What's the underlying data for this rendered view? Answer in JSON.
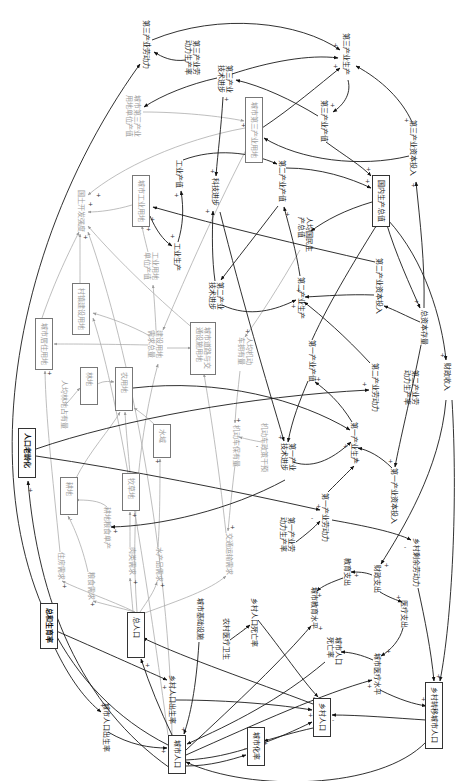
{
  "diagram": {
    "nodes": [
      {
        "label": "第三产业劳动力",
        "boxed": false,
        "tone": "black"
      },
      {
        "label": "第三产业劳动力生产率",
        "boxed": false,
        "tone": "black"
      },
      {
        "label": "城市第三产业用地单位产值",
        "boxed": false,
        "tone": "gray"
      },
      {
        "label": "第三产业技术进步",
        "boxed": false,
        "tone": "black"
      },
      {
        "label": "第三产业生产",
        "boxed": false,
        "tone": "black"
      },
      {
        "label": "第三产业产值",
        "boxed": false,
        "tone": "black"
      },
      {
        "label": "城市第三产业用地",
        "boxed": true,
        "tone": "gray"
      },
      {
        "label": "第三产业资本投入",
        "boxed": false,
        "tone": "black"
      },
      {
        "label": "工业产值",
        "boxed": false,
        "tone": "black"
      },
      {
        "label": "科技进步",
        "boxed": false,
        "tone": "black"
      },
      {
        "label": "第二产业产值",
        "boxed": false,
        "tone": "black"
      },
      {
        "label": "国内生产总值",
        "boxed": true,
        "tone": "black"
      },
      {
        "label": "城市工业用地",
        "boxed": true,
        "tone": "gray"
      },
      {
        "label": "国土开发强度",
        "boxed": false,
        "tone": "gray"
      },
      {
        "label": "工业生产",
        "boxed": false,
        "tone": "black"
      },
      {
        "label": "工业用地单位产值",
        "boxed": false,
        "tone": "gray"
      },
      {
        "label": "人均国民生产总值",
        "boxed": false,
        "tone": "black"
      },
      {
        "label": "第二产业技术进步",
        "boxed": false,
        "tone": "black"
      },
      {
        "label": "第二产业生产",
        "boxed": false,
        "tone": "black"
      },
      {
        "label": "第二产业资本投入",
        "boxed": false,
        "tone": "black"
      },
      {
        "label": "总资本存量",
        "boxed": false,
        "tone": "black"
      },
      {
        "label": "村镇建设用地",
        "boxed": true,
        "tone": "gray"
      },
      {
        "label": "城市居住用地",
        "boxed": true,
        "tone": "gray"
      },
      {
        "label": "建设用地需求总量",
        "boxed": false,
        "tone": "gray"
      },
      {
        "label": "城市道路与交通设施用地",
        "boxed": true,
        "tone": "gray"
      },
      {
        "label": "人均机动车拥有量",
        "boxed": false,
        "tone": "gray"
      },
      {
        "label": "第一产业产值",
        "boxed": false,
        "tone": "black"
      },
      {
        "label": "第二产业劳动力",
        "boxed": false,
        "tone": "black"
      },
      {
        "label": "第二产业劳动力生产率",
        "boxed": false,
        "tone": "black"
      },
      {
        "label": "财政收入",
        "boxed": false,
        "tone": "black"
      },
      {
        "label": "林地",
        "boxed": true,
        "tone": "gray"
      },
      {
        "label": "农用地",
        "boxed": true,
        "tone": "gray"
      },
      {
        "label": "人均林地占有量",
        "boxed": false,
        "tone": "gray"
      },
      {
        "label": "水域",
        "boxed": true,
        "tone": "gray"
      },
      {
        "label": "人口老龄化",
        "boxed": true,
        "tone": "black"
      },
      {
        "label": "第一产业生产",
        "boxed": false,
        "tone": "black"
      },
      {
        "label": "机动车保有量",
        "boxed": false,
        "tone": "gray"
      },
      {
        "label": "机动车政策干预",
        "boxed": false,
        "tone": "gray"
      },
      {
        "label": "第一产业技术进步",
        "boxed": false,
        "tone": "black"
      },
      {
        "label": "第一产业资本投入",
        "boxed": false,
        "tone": "black"
      },
      {
        "label": "耕地",
        "boxed": true,
        "tone": "gray"
      },
      {
        "label": "牧草地",
        "boxed": true,
        "tone": "gray"
      },
      {
        "label": "第一产业劳动力",
        "boxed": false,
        "tone": "black"
      },
      {
        "label": "耕地粮食单产",
        "boxed": false,
        "tone": "gray"
      },
      {
        "label": "第一产业劳动力生产率",
        "boxed": false,
        "tone": "black"
      },
      {
        "label": "交通运输需求",
        "boxed": false,
        "tone": "gray"
      },
      {
        "label": "乡村剩余劳动力",
        "boxed": false,
        "tone": "black"
      },
      {
        "label": "住房需求",
        "boxed": false,
        "tone": "gray"
      },
      {
        "label": "肉类需求",
        "boxed": false,
        "tone": "gray"
      },
      {
        "label": "水产品需求",
        "boxed": false,
        "tone": "gray"
      },
      {
        "label": "教育支出",
        "boxed": false,
        "tone": "black"
      },
      {
        "label": "财政支出",
        "boxed": false,
        "tone": "black"
      },
      {
        "label": "粮食需求",
        "boxed": false,
        "tone": "gray"
      },
      {
        "label": "城市教育水平",
        "boxed": false,
        "tone": "black"
      },
      {
        "label": "城市基础设施",
        "boxed": false,
        "tone": "black"
      },
      {
        "label": "医疗支出",
        "boxed": false,
        "tone": "black"
      },
      {
        "label": "乡村人口死亡率",
        "boxed": false,
        "tone": "black"
      },
      {
        "label": "总和生育率",
        "boxed": true,
        "tone": "black"
      },
      {
        "label": "总人口",
        "boxed": true,
        "tone": "black"
      },
      {
        "label": "农村医疗卫生",
        "boxed": false,
        "tone": "black"
      },
      {
        "label": "城市人口死亡率",
        "boxed": false,
        "tone": "black"
      },
      {
        "label": "城市医疗水平",
        "boxed": false,
        "tone": "black"
      },
      {
        "label": "乡村人口出生率",
        "boxed": false,
        "tone": "black"
      },
      {
        "label": "乡村转移城市人口",
        "boxed": true,
        "tone": "black"
      },
      {
        "label": "乡村人口",
        "boxed": true,
        "tone": "black"
      },
      {
        "label": "城市人口出生率",
        "boxed": false,
        "tone": "black"
      },
      {
        "label": "城市化率",
        "boxed": true,
        "tone": "black"
      },
      {
        "label": "城市人口",
        "boxed": true,
        "tone": "black"
      }
    ],
    "edges": [
      {
        "from": "城市人口",
        "to": "第三产业劳动力",
        "sign": "+"
      },
      {
        "from": "第三产业劳动力",
        "to": "第三产业生产",
        "sign": "+"
      },
      {
        "from": "第三产业劳动力生产率",
        "to": "第三产业劳动力",
        "sign": "+"
      },
      {
        "from": "第三产业技术进步",
        "to": "第三产业生产",
        "sign": "+"
      },
      {
        "from": "第三产业生产",
        "to": "第三产业产值",
        "sign": "+"
      },
      {
        "from": "第三产业产值",
        "to": "国内生产总值",
        "sign": "+"
      },
      {
        "from": "第三产业资本投入",
        "to": "第三产业生产",
        "sign": "+"
      },
      {
        "from": "城市第三产业用地",
        "to": "第三产业生产",
        "sign": "+"
      },
      {
        "from": "总资本存量",
        "to": "第三产业资本投入",
        "sign": "+"
      },
      {
        "from": "国内生产总值",
        "to": "总资本存量",
        "sign": "+"
      },
      {
        "from": "国内生产总值",
        "to": "财政收入",
        "sign": "+"
      },
      {
        "from": "国内生产总值",
        "to": "人均国民生产总值",
        "sign": "+"
      },
      {
        "from": "工业产值",
        "to": "第二产业产值",
        "sign": "+"
      },
      {
        "from": "工业生产",
        "to": "工业产值",
        "sign": "+"
      },
      {
        "from": "城市工业用地",
        "to": "工业生产",
        "sign": "+"
      },
      {
        "from": "第二产业产值",
        "to": "国内生产总值",
        "sign": "+"
      },
      {
        "from": "第二产业生产",
        "to": "第二产业产值",
        "sign": "+"
      },
      {
        "from": "第二产业技术进步",
        "to": "第二产业生产",
        "sign": "+"
      },
      {
        "from": "第二产业劳动力",
        "to": "第二产业生产",
        "sign": "+"
      },
      {
        "from": "第二产业资本投入",
        "to": "第二产业生产",
        "sign": "+"
      },
      {
        "from": "第一产业产值",
        "to": "国内生产总值",
        "sign": "+"
      },
      {
        "from": "第一产业生产",
        "to": "第一产业产值",
        "sign": "+"
      },
      {
        "from": "第一产业技术进步",
        "to": "第一产业生产",
        "sign": "+"
      },
      {
        "from": "第一产业劳动力",
        "to": "第一产业生产",
        "sign": "+"
      },
      {
        "from": "第一产业资本投入",
        "to": "第一产业生产",
        "sign": "+"
      },
      {
        "from": "第一产业劳动力生产率",
        "to": "第一产业劳动力",
        "sign": "-"
      },
      {
        "from": "第一产业劳动力",
        "to": "乡村剩余劳动力",
        "sign": "-"
      },
      {
        "from": "财政收入",
        "to": "财政支出",
        "sign": "+"
      },
      {
        "from": "财政支出",
        "to": "教育支出",
        "sign": "+"
      },
      {
        "from": "财政支出",
        "to": "医疗支出",
        "sign": "+"
      },
      {
        "from": "教育支出",
        "to": "城市教育水平",
        "sign": "+"
      },
      {
        "from": "医疗支出",
        "to": "城市医疗水平",
        "sign": "+"
      },
      {
        "from": "城市医疗水平",
        "to": "城市人口死亡率",
        "sign": "-"
      },
      {
        "from": "乡村剩余劳动力",
        "to": "乡村转移城市人口",
        "sign": "+"
      },
      {
        "from": "乡村转移城市人口",
        "to": "乡村人口",
        "sign": "-"
      },
      {
        "from": "乡村转移城市人口",
        "to": "城市人口",
        "sign": "+"
      },
      {
        "from": "城市人口出生率",
        "to": "城市人口",
        "sign": "+"
      },
      {
        "from": "城市人口死亡率",
        "to": "城市人口",
        "sign": "-"
      },
      {
        "from": "乡村人口出生率",
        "to": "乡村人口",
        "sign": "+"
      },
      {
        "from": "乡村人口死亡率",
        "to": "乡村人口",
        "sign": "-"
      },
      {
        "from": "农村医疗卫生",
        "to": "乡村人口死亡率",
        "sign": "-"
      },
      {
        "from": "总和生育率",
        "to": "城市人口出生率",
        "sign": "+"
      },
      {
        "from": "总和生育率",
        "to": "乡村人口出生率",
        "sign": "+"
      },
      {
        "from": "城市人口",
        "to": "总人口",
        "sign": "+"
      },
      {
        "from": "乡村人口",
        "to": "总人口",
        "sign": "+"
      },
      {
        "from": "城市人口",
        "to": "城市化率",
        "sign": "+"
      },
      {
        "from": "乡村人口",
        "to": "城市化率",
        "sign": "-"
      },
      {
        "from": "城市人口",
        "to": "人口老龄化",
        "sign": "+"
      },
      {
        "from": "人均国民生产总值",
        "to": "人均机动车拥有量",
        "sign": "+"
      },
      {
        "from": "人均机动车拥有量",
        "to": "机动车保有量",
        "sign": "+"
      },
      {
        "from": "机动车政策干预",
        "to": "机动车保有量",
        "sign": "-"
      },
      {
        "from": "机动车保有量",
        "to": "交通运输需求",
        "sign": "+"
      },
      {
        "from": "总人口",
        "to": "住房需求",
        "sign": "+"
      },
      {
        "from": "总人口",
        "to": "粮食需求",
        "sign": "+"
      },
      {
        "from": "总人口",
        "to": "肉类需求",
        "sign": "+"
      },
      {
        "from": "总人口",
        "to": "水产品需求",
        "sign": "+"
      },
      {
        "from": "住房需求",
        "to": "城市居住用地",
        "sign": "+"
      },
      {
        "from": "粮食需求",
        "to": "耕地",
        "sign": "+"
      },
      {
        "from": "肉类需求",
        "to": "牧草地",
        "sign": "+"
      },
      {
        "from": "水产品需求",
        "to": "水域",
        "sign": "+"
      },
      {
        "from": "耕地粮食单产",
        "to": "耕地",
        "sign": "-"
      },
      {
        "from": "人均林地占有量",
        "to": "林地",
        "sign": "+"
      },
      {
        "from": "城市居住用地",
        "to": "国土开发强度",
        "sign": "+"
      },
      {
        "from": "村镇建设用地",
        "to": "国土开发强度",
        "sign": "+"
      },
      {
        "from": "城市工业用地",
        "to": "国土开发强度",
        "sign": "+"
      },
      {
        "from": "城市第三产业用地",
        "to": "国土开发强度",
        "sign": "+"
      },
      {
        "from": "建设用地需求总量",
        "to": "城市居住用地",
        "sign": "+"
      },
      {
        "from": "建设用地需求总量",
        "to": "城市道路与交通设施用地",
        "sign": "+"
      }
    ],
    "signs": {
      "plus": "+",
      "minus": "-"
    }
  }
}
